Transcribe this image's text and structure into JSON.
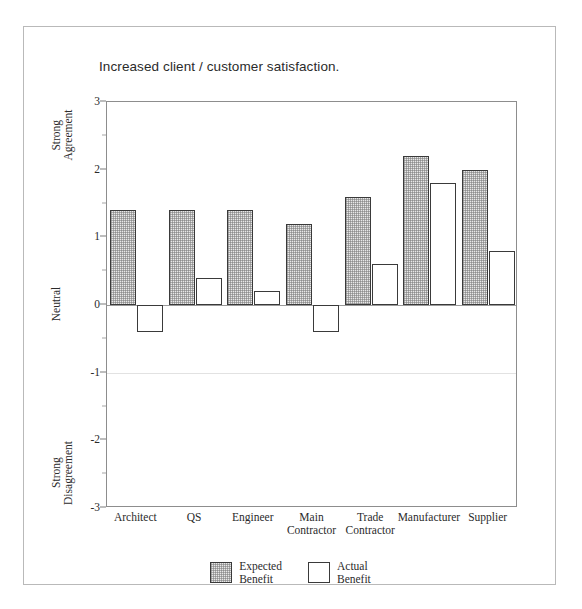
{
  "chart_data": {
    "type": "bar",
    "title": "Increased client / customer satisfaction.",
    "xlabel": "",
    "ylabel": "",
    "ylim": [
      -3,
      3
    ],
    "grid": false,
    "legend_position": "bottom-center",
    "categories": [
      "Architect",
      "QS",
      "Engineer",
      "Main\nContractor",
      "Trade\nContractor",
      "Manufacturer",
      "Supplier"
    ],
    "y_ticks": [
      3,
      2,
      1,
      0,
      -1,
      -2,
      -3
    ],
    "y_tick_labels": [
      "3",
      "2",
      "1",
      "0",
      "-1",
      "-2",
      "-3"
    ],
    "y_axis_anchors": [
      {
        "label": "Strong\nAgreement",
        "value": 2.5
      },
      {
        "label": "Neutral",
        "value": 0.0
      },
      {
        "label": "Strong\nDisagreement",
        "value": -2.5
      }
    ],
    "series": [
      {
        "name": "Expected\nBenefit",
        "legend_label": "Expected Benefit",
        "fill": "hatched-gray",
        "color": "#e8e8e8",
        "values": [
          1.4,
          1.4,
          1.4,
          1.2,
          1.6,
          2.2,
          2.0
        ]
      },
      {
        "name": "Actual\nBenefit",
        "legend_label": "Actual Benefit",
        "fill": "white",
        "color": "#ffffff",
        "values": [
          -0.4,
          0.4,
          0.2,
          -0.4,
          0.6,
          1.8,
          0.8
        ]
      }
    ]
  },
  "style": {
    "bar_border_color": "#3a3a3a",
    "axis_color": "#8d8d8d",
    "frame_color": "#b9b9b9",
    "text_color": "#2b2b2b"
  }
}
